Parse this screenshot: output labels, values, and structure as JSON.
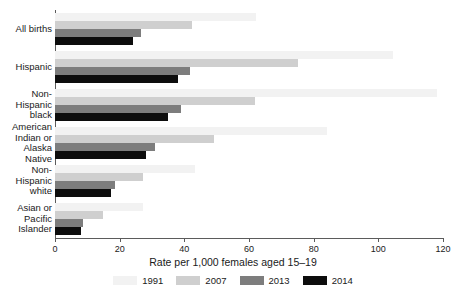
{
  "chart_data": {
    "type": "bar",
    "orientation": "horizontal",
    "title": "",
    "subtitle": "",
    "xlabel": "Rate per 1,000 females aged 15–19",
    "ylabel": "",
    "xlim": [
      0,
      120
    ],
    "xticks": [
      0,
      20,
      40,
      60,
      80,
      100,
      120
    ],
    "xtick_labels": [
      "0",
      "20",
      "40",
      "60",
      "80",
      "100",
      "120"
    ],
    "grid": false,
    "legend_position": "bottom",
    "categories": [
      "All births",
      "Hispanic",
      "Non-\nHispanic\nblack",
      "American\nIndian or\nAlaska\nNative",
      "Non-\nHispanic\nwhite",
      "Asian or\nPacific\nIslander"
    ],
    "series": [
      {
        "name": "1991",
        "color": "#f2f2f2",
        "values": [
          62.1,
          104.6,
          118.2,
          84.1,
          43.4,
          27.3
        ]
      },
      {
        "name": "2007",
        "color": "#cfcfcf",
        "values": [
          42.5,
          75.3,
          61.9,
          49.3,
          27.2,
          14.8
        ]
      },
      {
        "name": "2013",
        "color": "#7d7d7d",
        "values": [
          26.5,
          41.7,
          39.0,
          31.0,
          18.6,
          8.7
        ]
      },
      {
        "name": "2014",
        "color": "#0d0d0d",
        "values": [
          24.2,
          38.0,
          34.9,
          28.0,
          17.3,
          8.0
        ]
      }
    ]
  },
  "legend": {
    "entries": [
      {
        "label": "1991",
        "color": "#f2f2f2"
      },
      {
        "label": "2007",
        "color": "#cfcfcf"
      },
      {
        "label": "2013",
        "color": "#7d7d7d"
      },
      {
        "label": "2014",
        "color": "#0d0d0d"
      }
    ]
  },
  "axis": {
    "x_title": "Rate per 1,000 females aged 15–19"
  },
  "colors": {
    "axis": "#5b5b5b",
    "text": "#1a1a1a",
    "background": "#ffffff"
  }
}
